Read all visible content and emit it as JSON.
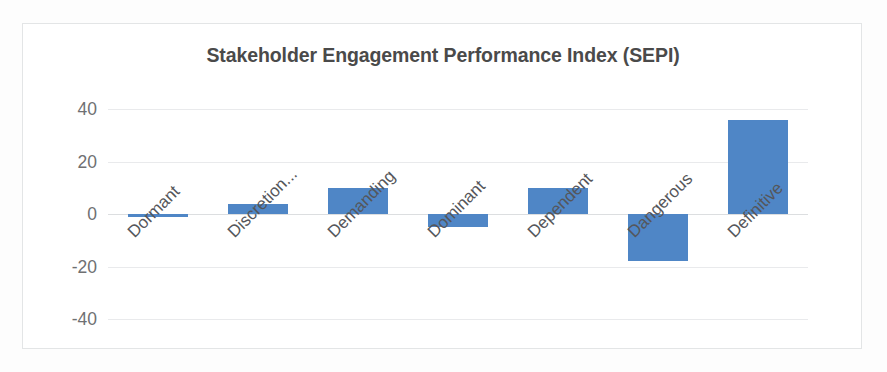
{
  "chart": {
    "title": "Stakeholder Engagement Performance Index (SEPI)",
    "accent_color": "#4f86c6",
    "gridline_color": "#e9eaec",
    "text_color": "#4a4a4a"
  },
  "chart_data": {
    "type": "bar",
    "title": "Stakeholder Engagement Performance Index (SEPI)",
    "xlabel": "",
    "ylabel": "",
    "categories": [
      "Dormant",
      "Discretion...",
      "Demanding",
      "Dominant",
      "Dependent",
      "Dangerous",
      "Definitive"
    ],
    "values": [
      -1,
      4,
      10,
      -5,
      10,
      -18,
      36
    ],
    "ylim": [
      -40,
      40
    ],
    "yticks": [
      40,
      20,
      0,
      -20,
      -40
    ],
    "ytick_labels": [
      "40",
      "20",
      "0",
      "-20",
      "-40"
    ],
    "grid": true,
    "legend": false,
    "legend_position": "none",
    "series": [
      {
        "name": "SEPI",
        "color": "#4f86c6",
        "values": [
          -1,
          4,
          10,
          -5,
          10,
          -18,
          36
        ]
      }
    ]
  }
}
